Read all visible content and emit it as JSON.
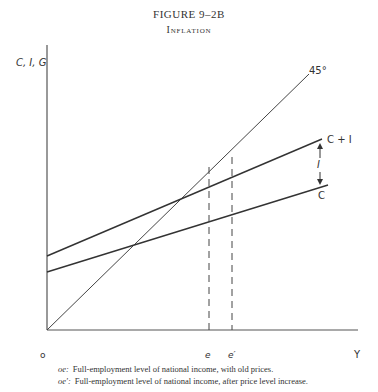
{
  "figure": {
    "title": "FIGURE 9–2B",
    "subtitle": "Inflation"
  },
  "axes": {
    "y_label": "C, I, G",
    "x_label": "Y",
    "origin_label": "o"
  },
  "lines": {
    "diagonal_label": "45°",
    "c_plus_i_label": "C + I",
    "c_label": "C",
    "gap_label": "I"
  },
  "x_markers": {
    "e": "e",
    "e_prime": "e′"
  },
  "captions": [
    {
      "key": "oe:",
      "text": "Full-employment level of national income, with old prices."
    },
    {
      "key": "oe′:",
      "text": "Full-employment level of national income, after price level increase."
    }
  ],
  "colors": {
    "ink": "#333333",
    "background": "#ffffff"
  }
}
